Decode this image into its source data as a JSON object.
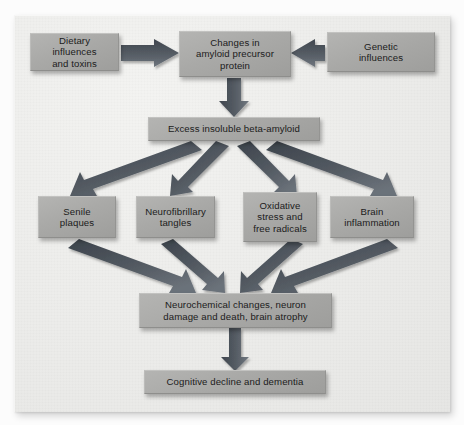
{
  "diagram": {
    "panel_color": "#ececea",
    "node_color": "#a9a9a7",
    "arrow_color": "#4a5058",
    "text_color": "#1b1b1b"
  },
  "nodes": {
    "dietary": {
      "label": "Dietary\ninfluences\nand toxins"
    },
    "app": {
      "label": "Changes in\namyloid precursor\nprotein"
    },
    "genetic": {
      "label": "Genetic\ninfluences"
    },
    "beta_amyloid": {
      "label": "Excess insoluble beta-amyloid"
    },
    "plaques": {
      "label": "Senile\nplaques"
    },
    "tangles": {
      "label": "Neurofibrillary\ntangles"
    },
    "oxidative": {
      "label": "Oxidative\nstress and\nfree radicals"
    },
    "inflammation": {
      "label": "Brain\ninflammation"
    },
    "neurochemical": {
      "label": "Neurochemical changes, neuron\ndamage and death, brain atrophy"
    },
    "cognitive": {
      "label": "Cognitive decline and dementia"
    }
  },
  "edges": [
    {
      "name": "dietary-to-app",
      "from": "dietary",
      "to": "app",
      "direction": "right"
    },
    {
      "name": "genetic-to-app",
      "from": "genetic",
      "to": "app",
      "direction": "left"
    },
    {
      "name": "app-to-beta-amyloid",
      "from": "app",
      "to": "beta_amyloid",
      "direction": "down"
    },
    {
      "name": "beta-amyloid-to-plaques",
      "from": "beta_amyloid",
      "to": "plaques",
      "direction": "down-left"
    },
    {
      "name": "beta-amyloid-to-tangles",
      "from": "beta_amyloid",
      "to": "tangles",
      "direction": "down-left"
    },
    {
      "name": "beta-amyloid-to-oxidative",
      "from": "beta_amyloid",
      "to": "oxidative",
      "direction": "down-right"
    },
    {
      "name": "beta-amyloid-to-inflammation",
      "from": "beta_amyloid",
      "to": "inflammation",
      "direction": "down-right"
    },
    {
      "name": "plaques-to-neurochemical",
      "from": "plaques",
      "to": "neurochemical",
      "direction": "down-right"
    },
    {
      "name": "tangles-to-neurochemical",
      "from": "tangles",
      "to": "neurochemical",
      "direction": "down-right"
    },
    {
      "name": "oxidative-to-neurochemical",
      "from": "oxidative",
      "to": "neurochemical",
      "direction": "down-left"
    },
    {
      "name": "inflammation-to-neurochemical",
      "from": "inflammation",
      "to": "neurochemical",
      "direction": "down-left"
    },
    {
      "name": "neurochemical-to-cognitive",
      "from": "neurochemical",
      "to": "cognitive",
      "direction": "down"
    }
  ]
}
